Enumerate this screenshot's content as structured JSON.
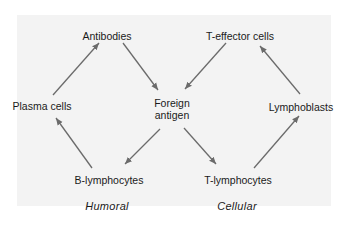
{
  "diagram": {
    "nodes": {
      "antibodies": "Antibodies",
      "plasma_cells": "Plasma cells",
      "b_lymphocytes": "B-lymphocytes",
      "foreign_antigen_line1": "Foreign",
      "foreign_antigen_line2": "antigen",
      "t_effector_cells": "T-effector cells",
      "lymphoblasts": "Lymphoblasts",
      "t_lymphocytes": "T-lymphocytes"
    },
    "categories": {
      "humoral": "Humoral",
      "cellular": "Cellular"
    },
    "edges": [
      {
        "from": "Plasma cells",
        "to": "Antibodies"
      },
      {
        "from": "Antibodies",
        "to": "Foreign antigen"
      },
      {
        "from": "Foreign antigen",
        "to": "B-lymphocytes"
      },
      {
        "from": "B-lymphocytes",
        "to": "Plasma cells"
      },
      {
        "from": "T-effector cells",
        "to": "Foreign antigen"
      },
      {
        "from": "Foreign antigen",
        "to": "T-lymphocytes"
      },
      {
        "from": "T-lymphocytes",
        "to": "Lymphoblasts"
      },
      {
        "from": "Lymphoblasts",
        "to": "T-effector cells"
      }
    ],
    "colors": {
      "panel_background": "#f3f3f3",
      "arrow": "#6b6b6b",
      "text": "#1a1a1a"
    }
  }
}
